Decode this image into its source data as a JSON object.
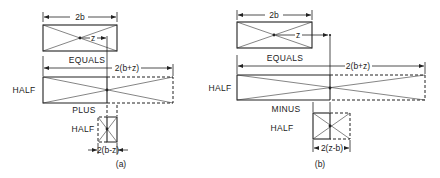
{
  "diagram": {
    "panels": [
      {
        "id": "a",
        "caption": "(a)",
        "top_width_label": "2b",
        "offset_label": "z",
        "equals_label": "EQUALS",
        "big_width_label": "2(b+z)",
        "big_label": "HALF",
        "operator_label": "PLUS",
        "small_label": "HALF",
        "small_width_label": "2(b-z)"
      },
      {
        "id": "b",
        "caption": "(b)",
        "top_width_label": "2b",
        "offset_label": "z",
        "equals_label": "EQUALS",
        "big_width_label": "2(b+z)",
        "big_label": "HALF",
        "operator_label": "MINUS",
        "small_label": "HALF",
        "small_width_label": "2(z-b)"
      }
    ],
    "colors": {
      "ink": "#222222",
      "background": "#ffffff"
    }
  }
}
